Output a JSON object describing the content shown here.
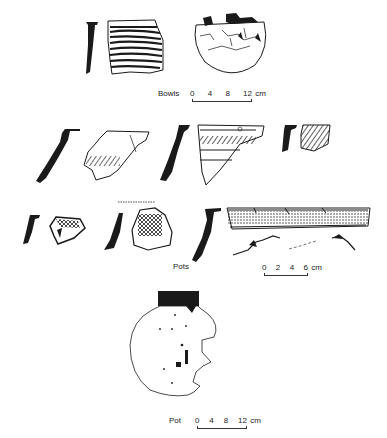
{
  "figure": {
    "groups": [
      {
        "label": "Bowls",
        "scale": {
          "ticks": [
            "0",
            "4",
            "8",
            "12"
          ],
          "unit": "cm"
        },
        "items": [
          "bowl-rim-profile",
          "bowl-striped-sherd",
          "bowl-restored-vessel"
        ]
      },
      {
        "label": "Pots",
        "scale": {
          "ticks": [
            "0",
            "2",
            "4",
            "6"
          ],
          "unit": "cm"
        },
        "items": [
          "pot-profile-1",
          "pot-sherd-1",
          "pot-profile-2",
          "pot-sherd-2",
          "pot-profile-3",
          "pot-sherd-3",
          "pot-profile-4",
          "pot-sherd-4",
          "pot-profile-5",
          "pot-sherd-5",
          "pot-profile-6",
          "pot-rim-band-sherd"
        ]
      },
      {
        "label": "Pot",
        "scale": {
          "ticks": [
            "0",
            "4",
            "8",
            "12"
          ],
          "unit": "cm"
        },
        "items": [
          "pot-restored-vessel"
        ]
      }
    ]
  },
  "colors": {
    "ink": "#1a1a1a",
    "paper": "#ffffff"
  }
}
